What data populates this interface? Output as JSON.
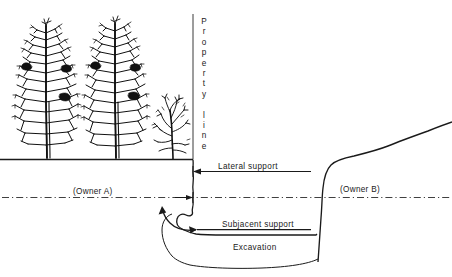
{
  "diagram": {
    "labels": {
      "property_line": "Property line",
      "property_line_chars": [
        "P",
        "r",
        "o",
        "p",
        "e",
        "r",
        "t",
        "y",
        "",
        "l",
        "i",
        "n",
        "e"
      ],
      "lateral_support": "Lateral support",
      "subjacent_support": "Subjacent support",
      "excavation": "Excavation",
      "owner_a": "(Owner A)",
      "owner_b": "(Owner B)"
    },
    "colors": {
      "ink": "#1a1a1a",
      "line": "#3a3a3a",
      "background": "#ffffff",
      "tree": "#111111"
    },
    "features": {
      "ground_surface_left": "horizontal ground line on Owner A side",
      "property_line_marker": "vertical line at property boundary",
      "boundary_datum": "dash-dot horizontal reference line across full width",
      "excavation_wall": "near-vertical cut face below Owner A land",
      "excavation_floor": "excavated pit bottom on Owner B side",
      "slope_right": "rising natural grade on Owner B side",
      "trees": [
        "conifer-large-left",
        "conifer-large-center",
        "bare-shrub-right"
      ]
    }
  }
}
